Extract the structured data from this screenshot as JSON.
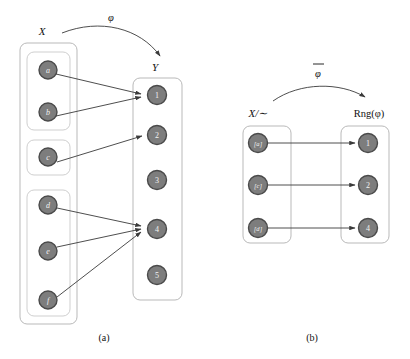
{
  "figure": {
    "background": "#ffffff",
    "node_fill": "#7d7d7d",
    "node_stroke": "#4a4a4a",
    "node_text": "#f2f2f2",
    "box_stroke": "#b9b9b9",
    "arrow_color": "#3a3a3a"
  },
  "panel_a": {
    "caption": "(a)",
    "map_label": "φ",
    "domain_label": "X",
    "codomain_label": "Y",
    "domain_classes": [
      {
        "id": "class-ab",
        "elements": [
          "a",
          "b"
        ]
      },
      {
        "id": "class-c",
        "elements": [
          "c"
        ]
      },
      {
        "id": "class-def",
        "elements": [
          "d",
          "e",
          "f"
        ]
      }
    ],
    "domain_elements": [
      "a",
      "b",
      "c",
      "d",
      "e",
      "f"
    ],
    "codomain_elements": [
      "1",
      "2",
      "3",
      "4",
      "5"
    ],
    "mappings": [
      {
        "from": "a",
        "to": "1"
      },
      {
        "from": "b",
        "to": "1"
      },
      {
        "from": "c",
        "to": "2"
      },
      {
        "from": "d",
        "to": "4"
      },
      {
        "from": "e",
        "to": "4"
      },
      {
        "from": "f",
        "to": "4"
      }
    ],
    "unmapped_codomain": [
      "3",
      "5"
    ]
  },
  "panel_b": {
    "caption": "(b)",
    "map_label": "φ",
    "map_label_has_overbar": true,
    "domain_label": "X/∼",
    "codomain_label": "Rng(φ)",
    "domain_elements": [
      "[a]",
      "[c]",
      "[d]"
    ],
    "codomain_elements": [
      "1",
      "2",
      "4"
    ],
    "mappings": [
      {
        "from": "[a]",
        "to": "1"
      },
      {
        "from": "[c]",
        "to": "2"
      },
      {
        "from": "[d]",
        "to": "4"
      }
    ]
  }
}
